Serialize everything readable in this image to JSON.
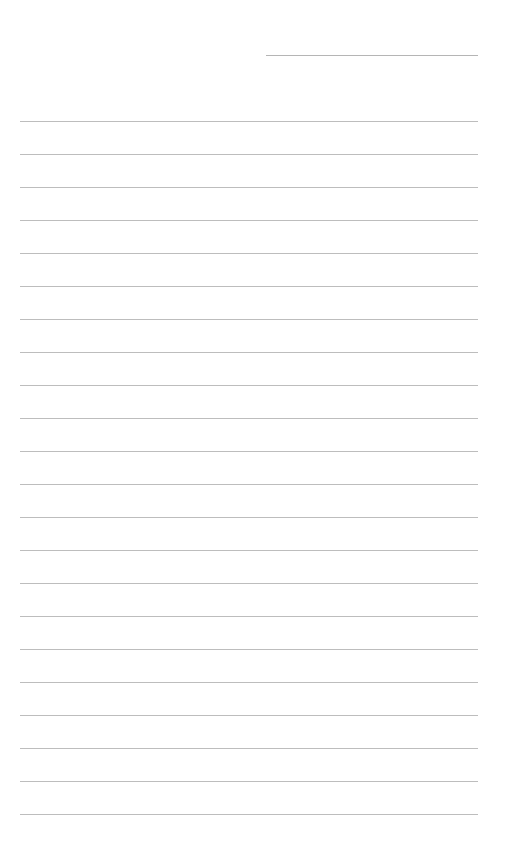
{
  "page": {
    "type": "lined-paper",
    "background_color": "#ffffff",
    "line_color": "#bdbdbd"
  },
  "header": {
    "text": ""
  },
  "lines": [
    {
      "text": ""
    },
    {
      "text": ""
    },
    {
      "text": ""
    },
    {
      "text": ""
    },
    {
      "text": ""
    },
    {
      "text": ""
    },
    {
      "text": ""
    },
    {
      "text": ""
    },
    {
      "text": ""
    },
    {
      "text": ""
    },
    {
      "text": ""
    },
    {
      "text": ""
    },
    {
      "text": ""
    },
    {
      "text": ""
    },
    {
      "text": ""
    },
    {
      "text": ""
    },
    {
      "text": ""
    },
    {
      "text": ""
    },
    {
      "text": ""
    },
    {
      "text": ""
    },
    {
      "text": ""
    },
    {
      "text": ""
    }
  ]
}
